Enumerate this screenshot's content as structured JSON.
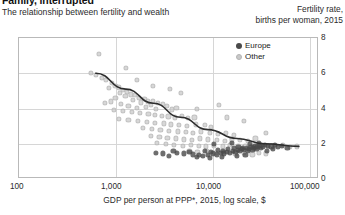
{
  "header": {
    "title": "Family, interrupted",
    "subtitle": "The relationship between fertility and wealth",
    "y_axis_title_line1": "Fertility rate,",
    "y_axis_title_line2": "births per woman, 2015"
  },
  "legend": {
    "position": "top-right",
    "entries": [
      {
        "label": "Europe",
        "color": "#4a4a4a",
        "marker": "filled-circle"
      },
      {
        "label": "Other",
        "color": "#c8c8c8",
        "marker": "filled-circle"
      }
    ]
  },
  "axes": {
    "x_label": "GDP per person at PPP*, 2015, log scale, $",
    "x_ticks": [
      "100",
      "1,000",
      "10,000",
      "100,000"
    ],
    "y_ticks": [
      "0",
      "2",
      "4",
      "6",
      "8"
    ]
  },
  "chart_data": {
    "type": "scatter",
    "title": "Family, interrupted",
    "subtitle": "The relationship between fertility and wealth",
    "xlabel": "GDP per person at PPP*, 2015, log scale, $",
    "ylabel": "Fertility rate, births per woman, 2015",
    "xscale": "log",
    "xlim": [
      100,
      200000
    ],
    "ylim": [
      0,
      8
    ],
    "x_ticks": [
      100,
      1000,
      10000,
      100000
    ],
    "y_ticks": [
      0,
      2,
      4,
      6,
      8
    ],
    "grid": true,
    "legend_position": "top-right",
    "series": [
      {
        "name": "Other",
        "color": "#c8c8c8",
        "points": [
          [
            760,
            7.1
          ],
          [
            620,
            6.0
          ],
          [
            700,
            5.9
          ],
          [
            820,
            5.75
          ],
          [
            900,
            5.6
          ],
          [
            1050,
            5.45
          ],
          [
            1150,
            5.3
          ],
          [
            980,
            5.15
          ],
          [
            1250,
            5.2
          ],
          [
            1400,
            5.05
          ],
          [
            1300,
            4.9
          ],
          [
            1550,
            4.95
          ],
          [
            1700,
            4.8
          ],
          [
            1480,
            4.7
          ],
          [
            1900,
            4.75
          ],
          [
            2100,
            4.6
          ],
          [
            1800,
            4.5
          ],
          [
            2400,
            4.55
          ],
          [
            2600,
            4.4
          ],
          [
            2200,
            4.35
          ],
          [
            3000,
            4.45
          ],
          [
            3400,
            4.3
          ],
          [
            2800,
            4.2
          ],
          [
            3800,
            4.25
          ],
          [
            1150,
            4.6
          ],
          [
            1020,
            4.4
          ],
          [
            880,
            4.3
          ],
          [
            1320,
            4.25
          ],
          [
            1600,
            4.15
          ],
          [
            2000,
            4.05
          ],
          [
            2500,
            4.1
          ],
          [
            3200,
            4.0
          ],
          [
            4200,
            4.15
          ],
          [
            4800,
            3.95
          ],
          [
            5400,
            4.05
          ],
          [
            1100,
            3.9
          ],
          [
            1400,
            3.85
          ],
          [
            1750,
            3.8
          ],
          [
            2150,
            3.75
          ],
          [
            2650,
            3.7
          ],
          [
            3100,
            3.65
          ],
          [
            3700,
            3.6
          ],
          [
            4400,
            3.55
          ],
          [
            5200,
            3.5
          ],
          [
            6200,
            3.6
          ],
          [
            7200,
            3.45
          ],
          [
            8500,
            3.5
          ],
          [
            1250,
            3.4
          ],
          [
            1600,
            3.35
          ],
          [
            2050,
            3.3
          ],
          [
            2550,
            3.25
          ],
          [
            3150,
            3.2
          ],
          [
            3900,
            3.15
          ],
          [
            4700,
            3.1
          ],
          [
            5800,
            3.05
          ],
          [
            7000,
            3.0
          ],
          [
            8800,
            3.1
          ],
          [
            11000,
            3.05
          ],
          [
            13000,
            2.95
          ],
          [
            2300,
            2.9
          ],
          [
            2900,
            2.85
          ],
          [
            3600,
            2.8
          ],
          [
            4500,
            2.75
          ],
          [
            5600,
            2.7
          ],
          [
            6800,
            2.65
          ],
          [
            8200,
            2.6
          ],
          [
            10000,
            2.7
          ],
          [
            12500,
            2.6
          ],
          [
            15500,
            2.55
          ],
          [
            19000,
            2.6
          ],
          [
            23000,
            2.5
          ],
          [
            2800,
            2.45
          ],
          [
            3500,
            2.4
          ],
          [
            4300,
            2.35
          ],
          [
            5300,
            2.3
          ],
          [
            6500,
            2.25
          ],
          [
            8000,
            2.2
          ],
          [
            9800,
            2.3
          ],
          [
            12000,
            2.25
          ],
          [
            15000,
            2.2
          ],
          [
            18500,
            2.15
          ],
          [
            22000,
            2.25
          ],
          [
            27000,
            2.2
          ],
          [
            33000,
            2.15
          ],
          [
            40000,
            2.3
          ],
          [
            3300,
            2.05
          ],
          [
            4100,
            2.0
          ],
          [
            5100,
            1.95
          ],
          [
            6300,
            1.9
          ],
          [
            7800,
            1.95
          ],
          [
            9500,
            1.9
          ],
          [
            11500,
            1.85
          ],
          [
            14000,
            1.9
          ],
          [
            17500,
            1.85
          ],
          [
            21000,
            1.95
          ],
          [
            26000,
            1.9
          ],
          [
            31000,
            1.85
          ],
          [
            38000,
            1.9
          ],
          [
            46000,
            1.95
          ],
          [
            55000,
            1.85
          ],
          [
            66000,
            1.9
          ],
          [
            80000,
            1.95
          ],
          [
            95000,
            1.8
          ],
          [
            115000,
            1.85
          ],
          [
            7500,
            1.6
          ],
          [
            9200,
            1.55
          ],
          [
            11800,
            1.6
          ],
          [
            14500,
            1.5
          ],
          [
            18000,
            1.55
          ],
          [
            24000,
            1.45
          ],
          [
            30000,
            1.5
          ],
          [
            37000,
            1.4
          ],
          [
            44000,
            1.5
          ],
          [
            52000,
            1.45
          ],
          [
            30000,
            3.3
          ],
          [
            19500,
            3.5
          ],
          [
            9000,
            4.0
          ],
          [
            16000,
            4.2
          ],
          [
            52000,
            2.6
          ],
          [
            4600,
            5.1
          ],
          [
            6000,
            4.9
          ],
          [
            3000,
            5.3
          ],
          [
            2000,
            5.6
          ],
          [
            1500,
            6.3
          ]
        ]
      },
      {
        "name": "Europe",
        "color": "#4a4a4a",
        "points": [
          [
            9000,
            1.25
          ],
          [
            10500,
            1.3
          ],
          [
            12000,
            1.35
          ],
          [
            13500,
            1.45
          ],
          [
            15000,
            1.4
          ],
          [
            16500,
            1.5
          ],
          [
            18000,
            1.45
          ],
          [
            19500,
            1.55
          ],
          [
            21000,
            1.5
          ],
          [
            22500,
            1.6
          ],
          [
            24000,
            1.55
          ],
          [
            25500,
            1.65
          ],
          [
            27000,
            1.6
          ],
          [
            28500,
            1.7
          ],
          [
            30000,
            1.65
          ],
          [
            32000,
            1.75
          ],
          [
            34000,
            1.7
          ],
          [
            36000,
            1.8
          ],
          [
            38000,
            1.75
          ],
          [
            40000,
            1.85
          ],
          [
            42000,
            1.8
          ],
          [
            45000,
            1.9
          ],
          [
            48000,
            1.85
          ],
          [
            51000,
            1.95
          ],
          [
            55000,
            1.9
          ],
          [
            60000,
            1.85
          ],
          [
            65000,
            1.95
          ],
          [
            70000,
            1.8
          ],
          [
            78000,
            1.9
          ],
          [
            90000,
            1.75
          ],
          [
            11000,
            1.6
          ],
          [
            13000,
            1.55
          ],
          [
            15500,
            1.65
          ],
          [
            17500,
            1.6
          ],
          [
            20000,
            1.7
          ],
          [
            23000,
            1.75
          ],
          [
            26000,
            1.8
          ],
          [
            29000,
            1.75
          ],
          [
            33000,
            1.6
          ],
          [
            37000,
            1.65
          ],
          [
            41000,
            1.7
          ],
          [
            46000,
            1.75
          ],
          [
            53000,
            1.6
          ],
          [
            62000,
            1.7
          ],
          [
            5500,
            1.5
          ],
          [
            6500,
            1.45
          ],
          [
            7500,
            1.55
          ],
          [
            8200,
            1.4
          ],
          [
            9600,
            1.35
          ],
          [
            4500,
            1.3
          ],
          [
            5000,
            1.6
          ],
          [
            3800,
            1.45
          ],
          [
            3200,
            1.5
          ],
          [
            14000,
            2.0
          ],
          [
            22000,
            2.05
          ],
          [
            35000,
            2.0
          ],
          [
            44000,
            2.05
          ],
          [
            12500,
            1.2
          ],
          [
            17000,
            1.25
          ],
          [
            25000,
            1.3
          ],
          [
            31000,
            1.35
          ]
        ]
      }
    ],
    "trend_line": {
      "description": "fitted log-linear fertility decline",
      "points": [
        [
          700,
          6.0
        ],
        [
          1500,
          5.1
        ],
        [
          3000,
          4.3
        ],
        [
          6000,
          3.5
        ],
        [
          12000,
          2.8
        ],
        [
          25000,
          2.3
        ],
        [
          50000,
          2.0
        ],
        [
          120000,
          1.85
        ]
      ]
    }
  }
}
